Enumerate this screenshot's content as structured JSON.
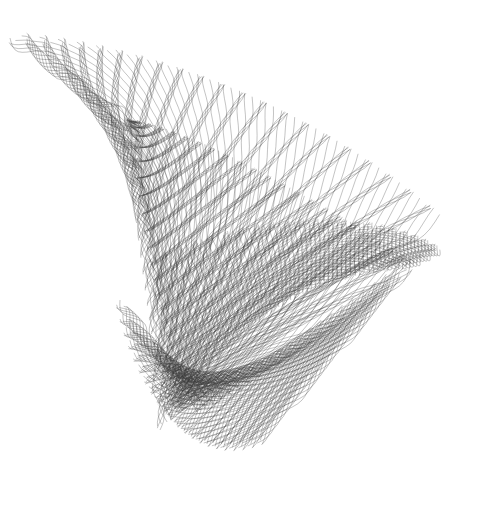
{
  "figure": {
    "background": "#ffffff",
    "stroke_color": "#3a3a3a",
    "stroke_opacity": 0.55,
    "stroke_width": 0.55,
    "loops": 150,
    "bands": [
      {
        "name": "outer-fan",
        "from": [
          [
            10,
            38
          ],
          [
            130,
            40
          ],
          [
            300,
            95
          ],
          [
            440,
            215
          ]
        ],
        "to": [
          [
            130,
            120
          ],
          [
            150,
            260
          ],
          [
            160,
            400
          ],
          [
            175,
            410
          ]
        ],
        "radius": 7
      },
      {
        "name": "inner-triangle",
        "from": [
          [
            130,
            120
          ],
          [
            200,
            130
          ],
          [
            330,
            210
          ],
          [
            410,
            260
          ]
        ],
        "to": [
          [
            130,
            120
          ],
          [
            150,
            260
          ],
          [
            175,
            380
          ],
          [
            180,
            410
          ]
        ],
        "radius": 5
      },
      {
        "name": "right-curl",
        "from": [
          [
            150,
            260
          ],
          [
            260,
            210
          ],
          [
            380,
            210
          ],
          [
            440,
            250
          ]
        ],
        "to": [
          [
            160,
            430
          ],
          [
            220,
            330
          ],
          [
            300,
            270
          ],
          [
            410,
            265
          ]
        ],
        "radius": 5
      },
      {
        "name": "bottom-loop",
        "from": [
          [
            120,
            300
          ],
          [
            140,
            400
          ],
          [
            190,
            470
          ],
          [
            260,
            440
          ]
        ],
        "to": [
          [
            200,
            410
          ],
          [
            250,
            380
          ],
          [
            330,
            320
          ],
          [
            410,
            265
          ]
        ],
        "radius": 6
      }
    ]
  }
}
